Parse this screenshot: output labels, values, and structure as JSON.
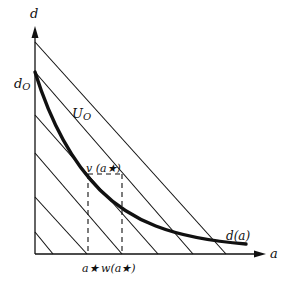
{
  "diagram": {
    "type": "economic-diagram",
    "axes": {
      "x_label": "a",
      "y_label": "d"
    },
    "labels": {
      "d0": "d",
      "d0_sub": "O",
      "U0": "U",
      "U0_sub": "O",
      "curve": "d(a)",
      "point": "v (a★)",
      "a_star": "a★",
      "w_a_star": "w(a★)"
    },
    "colors": {
      "line": "#111111",
      "background": "#ffffff"
    },
    "elements": [
      "y-axis with arrow labelled d",
      "x-axis with arrow labelled a",
      "parallel diagonal iso-lines (slope -1)",
      "convex curve d(a) starting at d_O",
      "dashed verticals at a★ and w(a★)"
    ]
  }
}
